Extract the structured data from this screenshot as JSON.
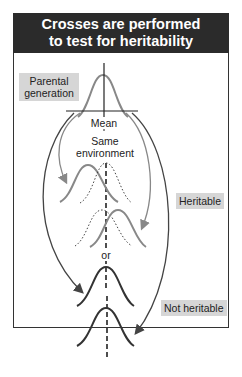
{
  "title": {
    "line1": "Crosses are performed",
    "line2": "to test for heritability"
  },
  "labels": {
    "parental_line1": "Parental",
    "parental_line2": "generation",
    "mean": "Mean",
    "same_env_line1": "Same",
    "same_env_line2": "environment",
    "or": "or",
    "heritable": "Heritable",
    "not_heritable": "Not heritable"
  },
  "colors": {
    "title_bg": "#2b2b2b",
    "label_bg": "#d6d6d6",
    "heritable_curve": "#888888",
    "not_heritable_curve": "#333333",
    "arrow_gray": "#888888",
    "arrow_dark": "#444444"
  }
}
